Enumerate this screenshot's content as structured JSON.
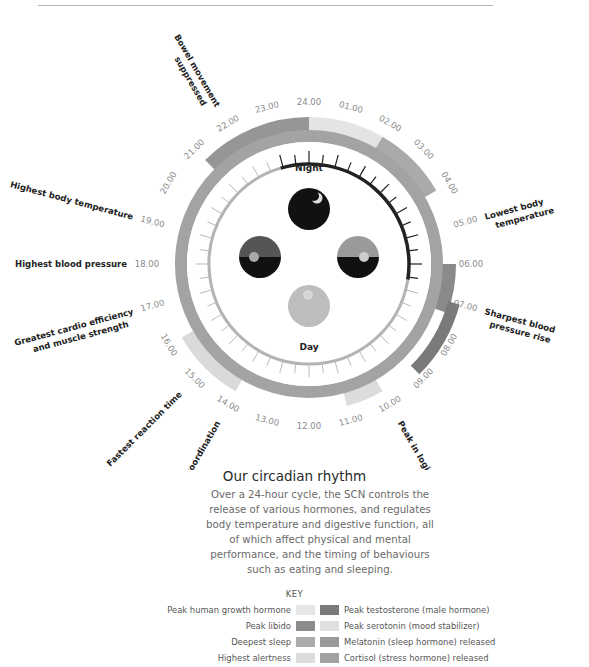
{
  "header": {
    "rule": true
  },
  "center": {
    "night_label": "Night",
    "day_label": "Day"
  },
  "hours": [
    "24.00",
    "01.00",
    "02.00",
    "03.00",
    "04.00",
    "05.00",
    "06.00",
    "07.00",
    "08.00",
    "09.00",
    "10.00",
    "11.00",
    "12.00",
    "13.00",
    "14.00",
    "15.00",
    "16.00",
    "17.00",
    "18.00",
    "19.00",
    "20.00",
    "21.00",
    "22.00",
    "23.00"
  ],
  "events": [
    {
      "id": "bowel",
      "lines": [
        "Bowel movement",
        "suppressed"
      ],
      "hour": 22
    },
    {
      "id": "lowest-temp",
      "lines": [
        "Lowest body",
        "temperature"
      ],
      "hour": 5
    },
    {
      "id": "bp-rise",
      "lines": [
        "Sharpest blood",
        "pressure rise"
      ],
      "hour": 7
    },
    {
      "id": "logic",
      "lines": [
        "Peak in logical reasoning"
      ],
      "hour": 10
    },
    {
      "id": "coordination",
      "lines": [
        "Best coordination"
      ],
      "hour": 14
    },
    {
      "id": "reaction",
      "lines": [
        "Fastest reaction time"
      ],
      "hour": 15
    },
    {
      "id": "cardio",
      "lines": [
        "Greatest cardio efficiency",
        "and muscle strength"
      ],
      "hour": 17
    },
    {
      "id": "high-bp",
      "lines": [
        "Highest blood pressure"
      ],
      "hour": 18
    },
    {
      "id": "high-temp",
      "lines": [
        "Highest body temperature"
      ],
      "hour": 19
    }
  ],
  "segments": [
    {
      "name": "Peak human growth hormone",
      "start": 0,
      "end": 2,
      "color": "#e4e4e4"
    },
    {
      "name": "Melatonin (sleep hormone) released",
      "start": 21,
      "end": 24,
      "color": "#969696"
    },
    {
      "name": "Deepest sleep",
      "start": 2,
      "end": 4,
      "color": "#aaaaaa"
    },
    {
      "name": "Peak libido",
      "start": 6,
      "end": 7.3,
      "color": "#8a8a8a"
    },
    {
      "name": "Peak testosterone (male hormone)",
      "start": 7,
      "end": 9,
      "color": "#7a7a7a"
    },
    {
      "name": "Peak serotonin (mood stabilizer)",
      "start": 10,
      "end": 11,
      "color": "#dcdcdc"
    },
    {
      "name": "Highest alertness",
      "start": 14,
      "end": 16,
      "color": "#dadada"
    }
  ],
  "title": "Our circadian rhythm",
  "description": "Over a 24-hour cycle, the SCN controls the release of various hormones, and regulates body temperature and digestive function, all of which affect physical and mental performance, and the timing of behaviours such as eating and sleeping.",
  "key": {
    "title": "KEY",
    "left": [
      {
        "label": "Peak human growth hormone",
        "color": "#e6e6e6"
      },
      {
        "label": "Peak libido",
        "color": "#8c8c8c"
      },
      {
        "label": "Deepest sleep",
        "color": "#ababab"
      },
      {
        "label": "Highest alertness",
        "color": "#dcdcdc"
      }
    ],
    "right": [
      {
        "label": "Peak testosterone (male hormone)",
        "color": "#7a7a7a"
      },
      {
        "label": "Peak serotonin (mood stabilizer)",
        "color": "#e0e0e0"
      },
      {
        "label": "Melatonin (sleep hormone) released",
        "color": "#9a9a9a"
      },
      {
        "label": "Cortisol (stress hormone) released",
        "color": "#a2a2a2"
      }
    ]
  },
  "colors": {
    "ring": "#a3a3a3",
    "night_arc": "#222222",
    "day_arc": "#b4b4b4",
    "text_dark": "#222222",
    "hour_text": "#8a8a8a"
  }
}
